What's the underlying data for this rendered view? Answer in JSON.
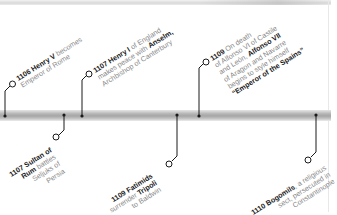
{
  "diagram": {
    "type": "timeline",
    "colors": {
      "bar": "#a8a8a8",
      "connector": "#1a1a1a",
      "year_text": "#1a1a1a",
      "body_text": "#8a8a8a",
      "background": "#ffffff"
    },
    "events_above": [
      {
        "year": "1106",
        "lines": [
          [
            {
              "t": "1106 Henry V",
              "b": true
            },
            {
              "t": " becomes",
              "b": false
            }
          ],
          [
            {
              "t": "Emperor of Rome",
              "b": false
            }
          ]
        ],
        "text": "1106 Henry V becomes Emperor of Rome"
      },
      {
        "year": "1107",
        "lines": [
          [
            {
              "t": "1107 Henry I",
              "b": true
            },
            {
              "t": " of England",
              "b": false
            }
          ],
          [
            {
              "t": "makes peace with ",
              "b": false
            },
            {
              "t": "Anselm,",
              "b": true
            }
          ],
          [
            {
              "t": "Archbishop of Canterbury",
              "b": false
            }
          ]
        ],
        "text": "1107 Henry I of England makes peace with Anselm, Archbishop of Canterbury"
      },
      {
        "year": "1109",
        "lines": [
          [
            {
              "t": "1109",
              "b": true
            },
            {
              "t": " On death",
              "b": false
            }
          ],
          [
            {
              "t": "of Alfonso VI of Castile",
              "b": false
            }
          ],
          [
            {
              "t": "and León, ",
              "b": false
            },
            {
              "t": "Alfonso VII",
              "b": true
            }
          ],
          [
            {
              "t": "of Aragon and Navarre",
              "b": false
            }
          ],
          [
            {
              "t": "begins to style himself",
              "b": false
            }
          ],
          [
            {
              "t": "“Emperor of the Spains”",
              "b": true
            }
          ]
        ],
        "text": "1109 On death of Alfonso VI of Castile and León, Alfonso VII of Aragon and Navarre begins to style himself \"Emperor of the Spains\""
      }
    ],
    "events_below": [
      {
        "year": "1107",
        "lines": [
          [
            {
              "t": "1107 Sultan of",
              "b": true
            }
          ],
          [
            {
              "t": "Rum",
              "b": true
            },
            {
              "t": " battles",
              "b": false
            }
          ],
          [
            {
              "t": "Seljuks of",
              "b": false
            }
          ],
          [
            {
              "t": "Persia",
              "b": false
            }
          ]
        ],
        "text": "1107 Sultan of Rum battles Seljuks of Persia"
      },
      {
        "year": "1109",
        "lines": [
          [
            {
              "t": "1109 Fatimids",
              "b": true
            }
          ],
          [
            {
              "t": "surrender ",
              "b": false
            },
            {
              "t": "Tripoli",
              "b": true
            }
          ],
          [
            {
              "t": "to Baldwin",
              "b": false
            }
          ]
        ],
        "text": "1109 Fatimids surrender Tripoli to Baldwin"
      },
      {
        "year": "1110",
        "lines": [
          [
            {
              "t": "1110 Bogomils",
              "b": true
            },
            {
              "t": ", a religious",
              "b": false
            }
          ],
          [
            {
              "t": "sect, persecuted in",
              "b": false
            }
          ],
          [
            {
              "t": "Constantinople",
              "b": false
            }
          ]
        ],
        "text": "1110 Bogomils, a religious sect, persecuted in Constantinople"
      }
    ]
  }
}
